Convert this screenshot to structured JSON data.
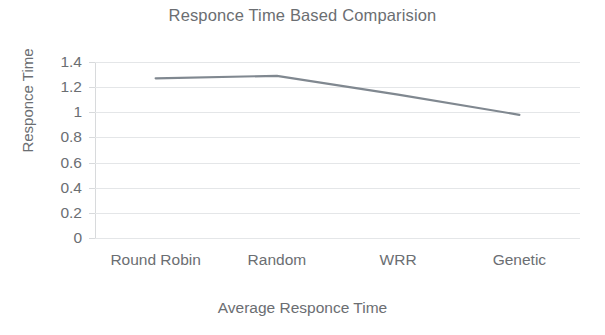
{
  "chart_data": {
    "type": "line",
    "title": "Responce Time Based Comparision",
    "xlabel": "Average Responce Time",
    "ylabel": "Responce Time",
    "categories": [
      "Round Robin",
      "Random",
      "WRR",
      "Genetic"
    ],
    "values": [
      1.27,
      1.29,
      1.14,
      0.98
    ],
    "series": [
      {
        "name": "Average Responce Time",
        "values": [
          1.27,
          1.29,
          1.14,
          0.98
        ],
        "color": "#808890"
      }
    ],
    "ylim": [
      0,
      1.4
    ],
    "ytick_labels": [
      "1.4",
      "1.2",
      "1",
      "0.8",
      "0.6",
      "0.4",
      "0.2",
      "0"
    ],
    "ytick_values": [
      1.4,
      1.2,
      1.0,
      0.8,
      0.6,
      0.4,
      0.2,
      0
    ],
    "grid": true,
    "legend": "none",
    "markers": "none",
    "line_color": "#808890",
    "grid_color": "#e4e6e8",
    "text_color": "#6b6e72",
    "background": "#ffffff"
  }
}
